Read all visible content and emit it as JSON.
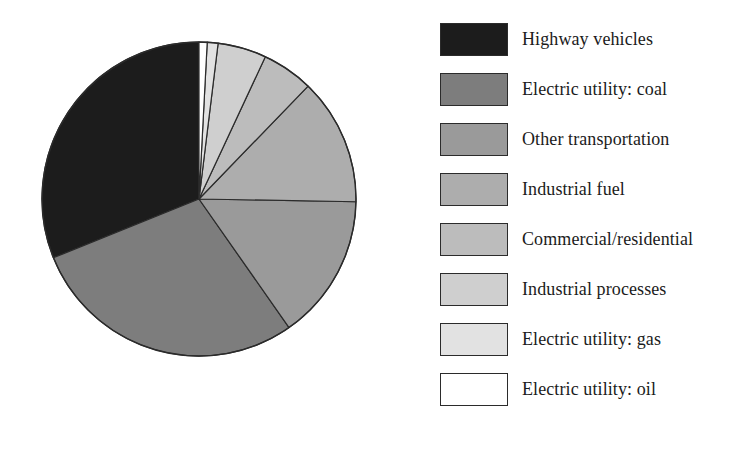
{
  "chart_data": {
    "type": "pie",
    "title": "",
    "subtitle": "",
    "xlabel": "",
    "ylabel": "",
    "legend_position": "right",
    "grid": false,
    "start_angle_deg": 0,
    "direction": "clockwise",
    "categories": [
      "Highway vehicles",
      "Electric utility: coal",
      "Other transportation",
      "Industrial fuel",
      "Commercial/residential",
      "Industrial processes",
      "Electric utility: gas",
      "Electric utility: oil"
    ],
    "values": [
      31,
      28,
      15,
      13,
      5,
      5,
      2,
      1
    ],
    "units": "percent",
    "slices": [
      {
        "label": "Highway vehicles",
        "value": 31,
        "color": "#1c1c1c",
        "start_deg": 248,
        "end_deg": 360
      },
      {
        "label": "Electric utility: coal",
        "value": 28,
        "color": "#7d7d7d",
        "start_deg": 145,
        "end_deg": 248
      },
      {
        "label": "Other transportation",
        "value": 15,
        "color": "#9a9a9a",
        "start_deg": 91,
        "end_deg": 145
      },
      {
        "label": "Industrial fuel",
        "value": 13,
        "color": "#adadad",
        "start_deg": 44,
        "end_deg": 91
      },
      {
        "label": "Commercial/residential",
        "value": 5,
        "color": "#bcbcbc",
        "start_deg": 25,
        "end_deg": 44
      },
      {
        "label": "Industrial processes",
        "value": 5,
        "color": "#cfcfcf",
        "start_deg": 7,
        "end_deg": 25
      },
      {
        "label": "Electric utility: gas",
        "value": 2,
        "color": "#e2e2e2",
        "start_deg": 3,
        "end_deg": 7
      },
      {
        "label": "Electric utility: oil",
        "value": 1,
        "color": "#ffffff",
        "start_deg": 0,
        "end_deg": 3
      }
    ],
    "geometry": {
      "cx": 199,
      "cy": 199,
      "r": 157
    },
    "stroke_color": "#2b2b2b"
  },
  "legend": {
    "items": [
      {
        "label": "Highway vehicles",
        "color": "#1c1c1c"
      },
      {
        "label": "Electric utility: coal",
        "color": "#7d7d7d"
      },
      {
        "label": "Other transportation",
        "color": "#9a9a9a"
      },
      {
        "label": "Industrial fuel",
        "color": "#adadad"
      },
      {
        "label": "Commercial/residential",
        "color": "#bcbcbc"
      },
      {
        "label": "Industrial processes",
        "color": "#cfcfcf"
      },
      {
        "label": "Electric utility: gas",
        "color": "#e2e2e2"
      },
      {
        "label": "Electric utility: oil",
        "color": "#ffffff"
      }
    ]
  }
}
